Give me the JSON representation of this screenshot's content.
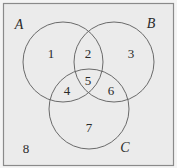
{
  "diagram": {
    "type": "venn",
    "colors": {
      "background": "#ebebeb",
      "border": "#8a8a8a",
      "circle_stroke": "#6a6a6a",
      "text": "#2a2a2a"
    },
    "universe": {
      "x": 3,
      "y": 3,
      "w": 170,
      "h": 162
    },
    "sets": [
      {
        "name": "A",
        "cx": 63,
        "cy": 62,
        "r": 40,
        "label_x": 19,
        "label_y": 25
      },
      {
        "name": "B",
        "cx": 114,
        "cy": 62,
        "r": 40,
        "label_x": 151,
        "label_y": 24
      },
      {
        "name": "C",
        "cx": 89,
        "cy": 109,
        "r": 40,
        "label_x": 125,
        "label_y": 148
      }
    ],
    "regions": [
      {
        "label": "1",
        "x": 51,
        "y": 53
      },
      {
        "label": "2",
        "x": 88,
        "y": 53
      },
      {
        "label": "3",
        "x": 131,
        "y": 53
      },
      {
        "label": "4",
        "x": 67,
        "y": 90
      },
      {
        "label": "5",
        "x": 88,
        "y": 80
      },
      {
        "label": "6",
        "x": 111,
        "y": 90
      },
      {
        "label": "7",
        "x": 89,
        "y": 127
      },
      {
        "label": "8",
        "x": 26,
        "y": 148
      }
    ]
  }
}
